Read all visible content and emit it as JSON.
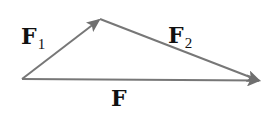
{
  "diagram": {
    "stroke_color": "#777777",
    "label_color": "#111111",
    "points": {
      "origin": [
        22,
        79
      ],
      "apex": [
        100,
        19
      ],
      "end": [
        261,
        81
      ]
    },
    "vectors": [
      {
        "id": "F1",
        "from": "origin",
        "to": "apex",
        "label_main": "F",
        "label_sub": "1"
      },
      {
        "id": "F2",
        "from": "apex",
        "to": "end",
        "label_main": "F",
        "label_sub": "2"
      },
      {
        "id": "F",
        "from": "origin",
        "to": "end",
        "label_main": "F",
        "label_sub": ""
      }
    ]
  }
}
